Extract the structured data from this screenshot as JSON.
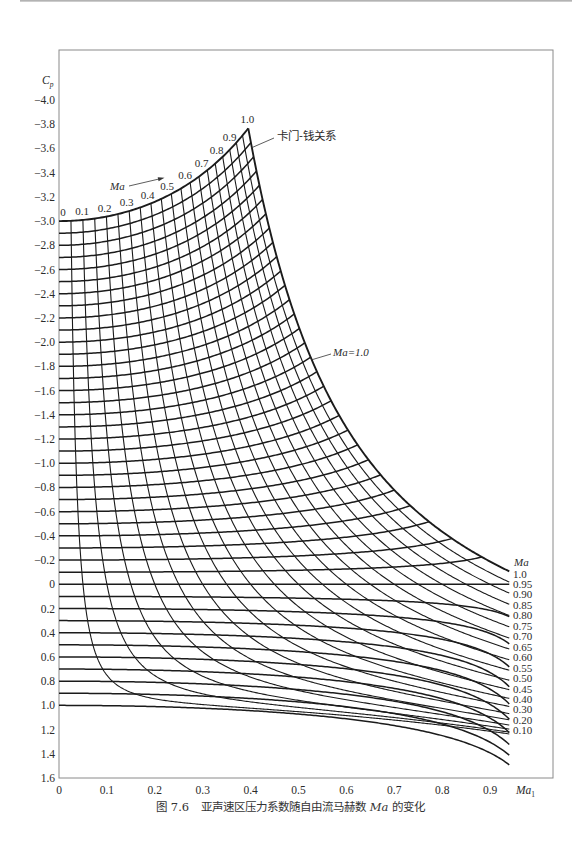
{
  "page": {
    "caption": {
      "figure_no": "图 7.6",
      "text_before": "亚声速区压力系数随自由流马赫数 ",
      "symbol": "Ma",
      "text_after": " 的变化"
    }
  },
  "chart_data": {
    "type": "line",
    "xlabel": {
      "symbol": "Ma",
      "subscript": "1"
    },
    "ylabel": {
      "symbol": "C",
      "subscript": "p"
    },
    "xlim": [
      0,
      1.03
    ],
    "ylim": [
      -4.0,
      1.6
    ],
    "y_inverted": true,
    "grid": false,
    "x_max_plotted": 0.94,
    "x_ticks": [
      {
        "value": 0,
        "label": "0"
      },
      {
        "value": 0.1,
        "label": "0.1"
      },
      {
        "value": 0.2,
        "label": "0.2"
      },
      {
        "value": 0.3,
        "label": "0.3"
      },
      {
        "value": 0.4,
        "label": "0.4"
      },
      {
        "value": 0.5,
        "label": "0.5"
      },
      {
        "value": 0.6,
        "label": "0.6"
      },
      {
        "value": 0.7,
        "label": "0.7"
      },
      {
        "value": 0.8,
        "label": "0.8"
      },
      {
        "value": 0.9,
        "label": "0.9"
      }
    ],
    "y_ticks": [
      {
        "value": -4.0,
        "label": "−4.0"
      },
      {
        "value": -3.8,
        "label": "−3.8"
      },
      {
        "value": -3.6,
        "label": "−3.6"
      },
      {
        "value": -3.4,
        "label": "−3.4"
      },
      {
        "value": -3.2,
        "label": "−3.2"
      },
      {
        "value": -3.0,
        "label": "−3.0"
      },
      {
        "value": -2.8,
        "label": "−2.8"
      },
      {
        "value": -2.6,
        "label": "−2.6"
      },
      {
        "value": -2.4,
        "label": "−2.4"
      },
      {
        "value": -2.2,
        "label": "−2.2"
      },
      {
        "value": -2.0,
        "label": "−2.0"
      },
      {
        "value": -1.8,
        "label": "−1.8"
      },
      {
        "value": -1.6,
        "label": "−1.6"
      },
      {
        "value": -1.4,
        "label": "−1.4"
      },
      {
        "value": -1.2,
        "label": "−1.2"
      },
      {
        "value": -1.0,
        "label": "−1.0"
      },
      {
        "value": -0.8,
        "label": "−0.8"
      },
      {
        "value": -0.6,
        "label": "−0.6"
      },
      {
        "value": -0.4,
        "label": "−0.4"
      },
      {
        "value": -0.2,
        "label": "−0.2"
      },
      {
        "value": 0,
        "label": "0"
      },
      {
        "value": 0.2,
        "label": "0.2"
      },
      {
        "value": 0.4,
        "label": "0.4"
      },
      {
        "value": 0.6,
        "label": "0.6"
      },
      {
        "value": 0.8,
        "label": "0.8"
      },
      {
        "value": 1.0,
        "label": "1.0"
      },
      {
        "value": 1.2,
        "label": "1.2"
      },
      {
        "value": 1.4,
        "label": "1.4"
      },
      {
        "value": 1.6,
        "label": "1.6"
      }
    ],
    "incompressible_cp_lines": {
      "relation": "Kármán–Tsien",
      "cp0_values": [
        -3.0,
        -2.9,
        -2.8,
        -2.7,
        -2.6,
        -2.5,
        -2.4,
        -2.3,
        -2.2,
        -2.1,
        -2.0,
        -1.9,
        -1.8,
        -1.7,
        -1.6,
        -1.5,
        -1.4,
        -1.3,
        -1.2,
        -1.1,
        -1.0,
        -0.9,
        -0.8,
        -0.7,
        -0.6,
        -0.5,
        -0.4,
        -0.3,
        -0.2,
        -0.1,
        0.0,
        0.1,
        0.2,
        0.3,
        0.4,
        0.5,
        0.6,
        0.7,
        0.8,
        0.9,
        1.0
      ]
    },
    "local_mach_curves": {
      "relation": "isentropic",
      "gamma": 1.4,
      "ma_values": [
        0.05,
        0.1,
        0.15,
        0.2,
        0.25,
        0.3,
        0.35,
        0.4,
        0.45,
        0.5,
        0.55,
        0.6,
        0.65,
        0.7,
        0.75,
        0.8,
        0.85,
        0.9,
        0.95,
        1.0
      ]
    },
    "top_arrow_label": "Ma",
    "top_labels": [
      {
        "ma": 0,
        "text": "0"
      },
      {
        "ma": 0.1,
        "text": "0.1"
      },
      {
        "ma": 0.2,
        "text": "0.2"
      },
      {
        "ma": 0.3,
        "text": "0.3"
      },
      {
        "ma": 0.4,
        "text": "0.4"
      },
      {
        "ma": 0.5,
        "text": "0.5"
      },
      {
        "ma": 0.6,
        "text": "0.6"
      },
      {
        "ma": 0.7,
        "text": "0.7"
      },
      {
        "ma": 0.8,
        "text": "0.8"
      },
      {
        "ma": 0.9,
        "text": "0.9"
      },
      {
        "ma": 1.0,
        "text": "1.0"
      }
    ],
    "right_labels_header": "Ma",
    "right_labels": [
      {
        "ma": 1.0,
        "text": "1.0"
      },
      {
        "ma": 0.95,
        "text": "0.95"
      },
      {
        "ma": 0.9,
        "text": "0.90"
      },
      {
        "ma": 0.85,
        "text": "0.85"
      },
      {
        "ma": 0.8,
        "text": "0.80"
      },
      {
        "ma": 0.75,
        "text": "0.75"
      },
      {
        "ma": 0.7,
        "text": "0.70"
      },
      {
        "ma": 0.65,
        "text": "0.65"
      },
      {
        "ma": 0.6,
        "text": "0.60"
      },
      {
        "ma": 0.55,
        "text": "0.55"
      },
      {
        "ma": 0.5,
        "text": "0.50"
      },
      {
        "ma": 0.45,
        "text": "0.45"
      },
      {
        "ma": 0.4,
        "text": "0.40"
      },
      {
        "ma": 0.3,
        "text": "0.30"
      },
      {
        "ma": 0.2,
        "text": "0.20"
      },
      {
        "ma": 0.1,
        "text": "0.10"
      }
    ],
    "annotations": {
      "karman_tsien": "卡门-钱关系",
      "critical": "Ma=1.0"
    },
    "key_readings": [
      {
        "curve": "cp0 = -3.0",
        "ma_inf": 0,
        "cp": -3.0
      },
      {
        "curve": "cp0 = -3.0 at Ma = 1.0 (critical)",
        "ma_inf": 0.39,
        "cp": -3.75
      },
      {
        "curve": "Ma = 1.0 (critical)",
        "ma_inf": 0.94,
        "cp": -0.1
      },
      {
        "curve": "cp0 = 0",
        "ma_inf": 0.94,
        "cp": 0
      },
      {
        "curve": "cp0 = 1.0",
        "ma_inf": 0.94,
        "cp": 1.5
      }
    ]
  }
}
